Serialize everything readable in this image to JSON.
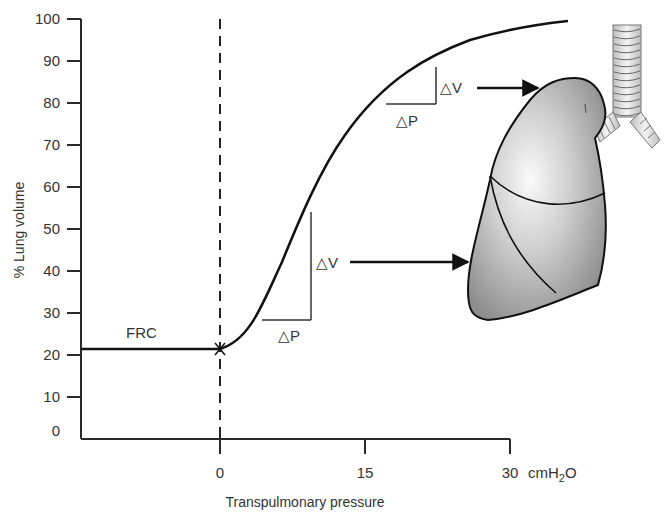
{
  "chart_data": {
    "type": "line",
    "title": "",
    "xlabel": "Transpulmonary pressure",
    "xunit": "cmH2O",
    "xunit_parts": {
      "base": "cmH",
      "sub": "2",
      "tail": "O"
    },
    "ylabel": "% Lung volume",
    "xlim": [
      -14.5,
      30
    ],
    "ylim": [
      0,
      100
    ],
    "x_ticks": [
      0,
      15,
      30
    ],
    "x_tick_labels": [
      "0",
      "15",
      "30"
    ],
    "y_ticks": [
      0,
      10,
      20,
      30,
      40,
      50,
      60,
      70,
      80,
      90,
      100
    ],
    "y_tick_labels": [
      "0",
      "10",
      "20",
      "30",
      "40",
      "50",
      "60",
      "70",
      "80",
      "90",
      "100"
    ],
    "grid": false,
    "legend": null,
    "series": [
      {
        "name": "Pressure-volume curve",
        "x": [
          -14.5,
          -10,
          -5,
          0,
          2,
          4,
          6,
          8,
          10,
          12,
          14,
          16,
          18,
          20,
          22,
          24,
          26,
          28,
          30,
          32
        ],
        "y": [
          20,
          20,
          20,
          20,
          22,
          26,
          33,
          42,
          52,
          61,
          68,
          74,
          79,
          83,
          87,
          90,
          93,
          95,
          97,
          98
        ]
      }
    ],
    "annotations": [
      {
        "text": "FRC",
        "x": -6,
        "y": 22
      },
      {
        "text": "△V",
        "role": "volume change (steep region)",
        "x": 10.5,
        "y": 40
      },
      {
        "text": "△P",
        "role": "pressure change (steep region)",
        "x": 7.5,
        "y": 23
      },
      {
        "text": "△V",
        "role": "volume change (flat region)",
        "x": 23,
        "y": 82
      },
      {
        "text": "△P",
        "role": "pressure change (flat region)",
        "x": 19.5,
        "y": 75
      }
    ],
    "reference_lines": [
      {
        "type": "vertical",
        "x": 0,
        "style": "dashed"
      }
    ],
    "markers": [
      {
        "x": 0,
        "y": 20,
        "symbol": "x",
        "label": "FRC"
      }
    ]
  },
  "labels": {
    "frc": "FRC",
    "delta_v": "△V",
    "delta_p": "△P"
  },
  "illustration": {
    "name": "lung-with-trachea",
    "lobe_colors": {
      "outline": "#111111",
      "shade_dark": "#8a8a8a",
      "shade_light": "#f2f2f2"
    }
  },
  "colors": {
    "axis": "#2a2a2a",
    "curve": "#111111",
    "text": "#333333"
  }
}
